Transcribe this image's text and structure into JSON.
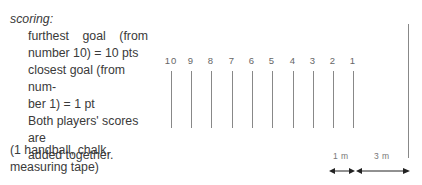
{
  "scoring": {
    "heading": "scoring:",
    "line1": "furthest goal (from",
    "line2": "number 10) = 10 pts",
    "line3": "closest goal (from num-",
    "line4": "ber 1) = 1 pt",
    "line5": "Both players' scores are",
    "line6": "added together."
  },
  "equipment": {
    "line1": "(1 handball, chalk,",
    "line2": "measuring tape)"
  },
  "goals": [
    {
      "number": "10",
      "x": 171
    },
    {
      "number": "9",
      "x": 191
    },
    {
      "number": "8",
      "x": 211
    },
    {
      "number": "7",
      "x": 232
    },
    {
      "number": "6",
      "x": 252
    },
    {
      "number": "5",
      "x": 272
    },
    {
      "number": "4",
      "x": 293
    },
    {
      "number": "3",
      "x": 313
    },
    {
      "number": "2",
      "x": 333
    },
    {
      "number": "1",
      "x": 353
    }
  ],
  "dimensions": {
    "gap_label": "1 m",
    "throw_label": "3 m"
  },
  "colors": {
    "line": "#888888",
    "text": "#3a3a3a"
  }
}
